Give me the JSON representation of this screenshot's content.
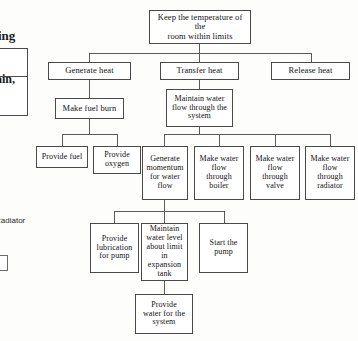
{
  "page": {
    "type": "scanned-document-diagram",
    "diagram_title": "Functional decomposition tree for room heating system",
    "ink_color": "#111111",
    "line_color": "#5a5a5a",
    "box_border_color": "#4a4a4a",
    "background_color": "#fdfdfc"
  },
  "margin_fragments": {
    "top_text_fragment": "ing",
    "table_text_fragment": "ain,",
    "side_label": "Radiator"
  },
  "tree": {
    "root": {
      "label": "Keep  the temperature of the\nroom within limits"
    },
    "level2": [
      {
        "label": "Generate heat"
      },
      {
        "label": "Transfer heat"
      },
      {
        "label": "Release heat"
      }
    ],
    "level3": [
      {
        "label": "Make fuel burn"
      },
      {
        "label": "Maintain water\nflow through the\nsystem"
      }
    ],
    "level4": [
      {
        "label": "Provide fuel"
      },
      {
        "label": "Provide\noxygen"
      },
      {
        "label": "Generate\nmomentum\nfor water\nflow"
      },
      {
        "label": "Make water\nflow\nthrough\nboiler"
      },
      {
        "label": "Make water\nflow\nthrough\nvalve"
      },
      {
        "label": "Make water\nflow\nthrough\nradiator"
      }
    ],
    "level5": [
      {
        "label": "Provide\nlubrication\nfor pump"
      },
      {
        "label": "Maintain\nwater level\nabout limit\nin expansion\ntank"
      },
      {
        "label": "Start the\npump"
      }
    ],
    "level6": [
      {
        "label": "Provide\nwater for the\nsystem"
      }
    ]
  }
}
